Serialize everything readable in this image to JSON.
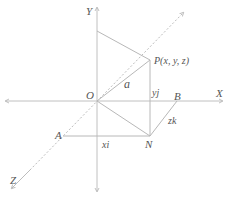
{
  "diagram": {
    "type": "3d-vector-coordinate-figure",
    "axes": {
      "x_label": "X",
      "y_label": "Y",
      "z_label": "Z"
    },
    "points": {
      "origin": "O",
      "p": "P(x, y, z)",
      "a": "A",
      "b": "B",
      "n": "N"
    },
    "vector_labels": {
      "position_vector": "a",
      "x_component": "xi",
      "y_component": "yj",
      "z_component": "zk"
    },
    "colors": {
      "line": "#b8b8b8",
      "text": "#555555",
      "background": "#ffffff"
    }
  }
}
